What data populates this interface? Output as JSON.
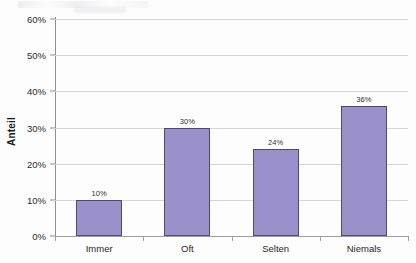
{
  "chart_data": {
    "type": "bar",
    "title": "",
    "subtitle": "",
    "xlabel": "",
    "ylabel": "Anteil",
    "categories": [
      "Immer",
      "Oft",
      "Selten",
      "Niemals"
    ],
    "values": [
      10,
      30,
      24,
      36
    ],
    "value_labels": [
      "10%",
      "30%",
      "24%",
      "36%"
    ],
    "ylim": [
      0,
      60
    ],
    "y_ticks": [
      0,
      10,
      20,
      30,
      40,
      50,
      60
    ],
    "y_tick_labels": [
      "0%",
      "10%",
      "20%",
      "30%",
      "40%",
      "50%",
      "60%"
    ],
    "grid": true,
    "legend": false,
    "legend_position": "none",
    "series": [
      {
        "name": "Anteil",
        "values": [
          10,
          30,
          24,
          36
        ],
        "color": "#9a91ca",
        "border_color": "#4e4a6e"
      }
    ],
    "colors": {
      "bar_fill": "#9a91ca",
      "bar_border": "#4e4a6e",
      "gridline": "#d6d6d9",
      "axis": "#8e8e8e",
      "text": "#1f1f1f",
      "background": "#fdfdfd"
    }
  }
}
